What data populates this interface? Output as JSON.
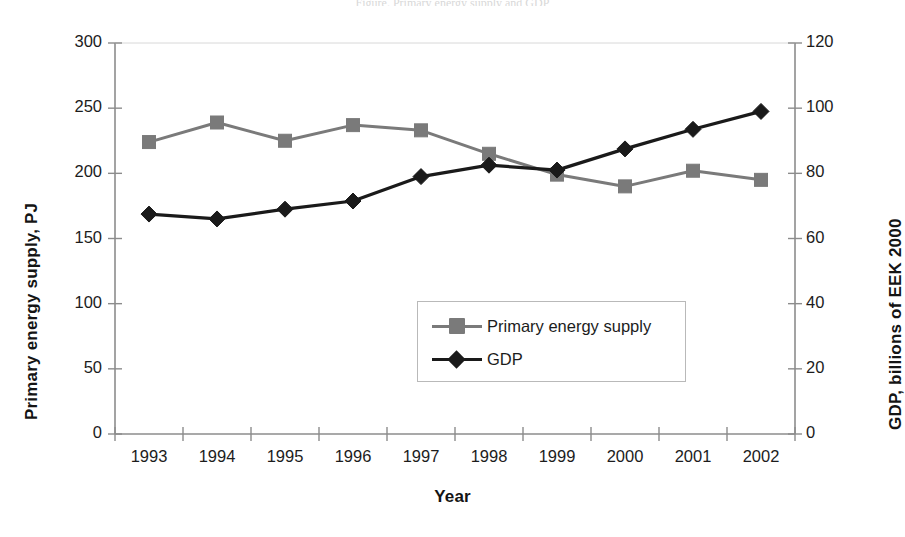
{
  "figure": {
    "top_caption": "Figure. Primary energy supply and GDP",
    "background_color": "#ffffff"
  },
  "chart_data": {
    "type": "line",
    "title": "",
    "xlabel": "Year",
    "grid": false,
    "legend_position": "center-bottom-inside",
    "categories": [
      "1993",
      "1994",
      "1995",
      "1996",
      "1997",
      "1998",
      "1999",
      "2000",
      "2001",
      "2002"
    ],
    "axes": {
      "left": {
        "label": "Primary energy supply, PJ",
        "ticks": [
          "0",
          "50",
          "100",
          "150",
          "200",
          "250",
          "300"
        ],
        "ylim": [
          0,
          300
        ],
        "step": 50
      },
      "right": {
        "label": "GDP, billions of EEK 2000",
        "ticks": [
          "0",
          "20",
          "40",
          "60",
          "80",
          "100",
          "120"
        ],
        "ylim": [
          0,
          120
        ],
        "step": 20
      }
    },
    "series": [
      {
        "name": "Primary energy supply",
        "axis": "left",
        "color": "#7a7a7a",
        "marker": "square",
        "values": [
          224,
          239,
          225,
          237,
          233,
          215,
          199,
          190,
          202,
          195
        ]
      },
      {
        "name": "GDP",
        "axis": "right",
        "color": "#1a1a1a",
        "marker": "diamond",
        "values": [
          67.5,
          66.0,
          69.0,
          71.5,
          79.0,
          82.5,
          81.0,
          87.5,
          93.5,
          99.0
        ]
      }
    ]
  },
  "legend": {
    "entries": [
      {
        "label": "Primary energy supply"
      },
      {
        "label": "GDP"
      }
    ]
  }
}
